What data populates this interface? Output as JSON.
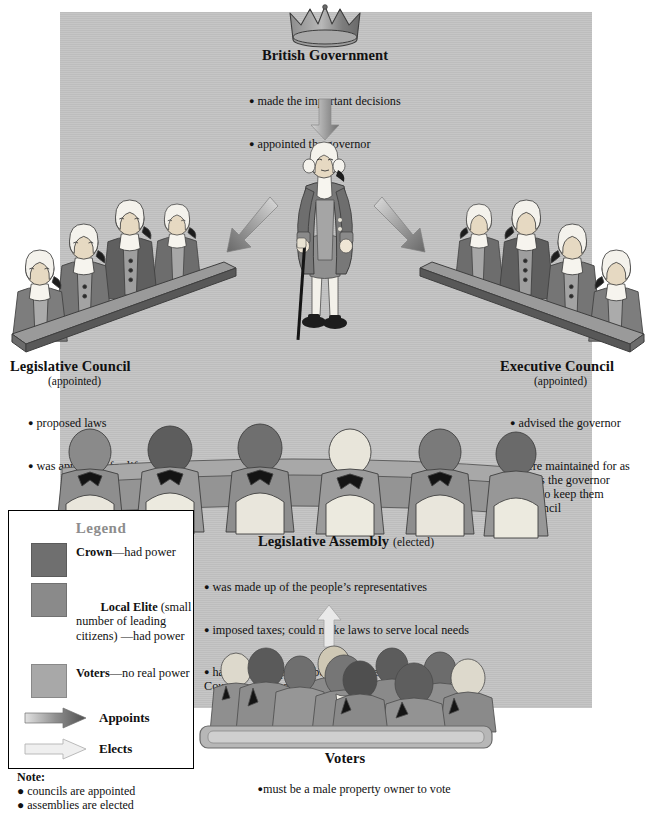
{
  "diagram": {
    "title_hidden": "Government of Upper Canada / British Colonial Government Structure",
    "background_color": "#c3c3c3",
    "crown_icon": "crown-icon"
  },
  "nodes": {
    "british_government": {
      "title": "British Government",
      "bullets": [
        "made the important decisions",
        "appointed the governor"
      ]
    },
    "lieutenant_governor": {
      "title": "Lieutenant-Governor",
      "bullets": [
        "tried to carry out wishes of British government",
        "was very powerful"
      ]
    },
    "legislative_council": {
      "title": "Legislative Council",
      "subtitle": "(appointed)",
      "bullets": [
        "proposed laws",
        "was appointed for life"
      ]
    },
    "executive_council": {
      "title": "Executive Council",
      "subtitle": "(appointed)",
      "bullets": [
        "advised the governor",
        "were maintained for as\nlong as the governor\nchose to keep them\non council"
      ]
    },
    "legislative_assembly": {
      "title": "Legislative Assembly",
      "subtitle": "(elected)",
      "bullets": [
        "was made up of the people’s representatives",
        "imposed taxes; could make laws to serve local needs",
        "had little real power because governor, Legislative\nCouncil, and Executive Council could veto its laws"
      ]
    },
    "voters": {
      "title": "Voters",
      "bullets": [
        "must be a male property owner to vote"
      ]
    }
  },
  "legend": {
    "heading": "Legend",
    "swatches": [
      {
        "label_bold": "Crown",
        "label_rest": "—had power",
        "color": "#6f6f6f"
      },
      {
        "label_bold": "Local Elite",
        "label_rest": " (small\nnumber of leading\ncitizens) —had power",
        "color": "#8a8a8a"
      },
      {
        "label_bold": "Voters",
        "label_rest": "—no real power",
        "color": "#a8a8a8"
      }
    ],
    "arrows": [
      {
        "label": "Appoints",
        "style": "dark",
        "name": "appoints-arrow"
      },
      {
        "label": "Elects",
        "style": "light",
        "name": "elects-arrow"
      }
    ],
    "note_heading": "Note:",
    "note_bullets": [
      "councils are appointed",
      "assemblies are elected"
    ]
  },
  "arrows": {
    "appoints_down": "appoints-arrow-down",
    "appoints_left": "appoints-arrow-left",
    "appoints_right": "appoints-arrow-right",
    "elects_up": "elects-arrow-up"
  }
}
